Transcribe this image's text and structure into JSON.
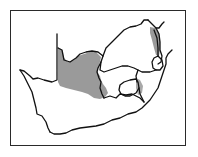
{
  "map": {
    "type": "distribution-map",
    "region": "Southern Africa",
    "colors": {
      "background": "#ffffff",
      "frame": "#2a2a2a",
      "borders": "#111111",
      "distribution_fill": "#9a9a9a"
    },
    "layers": [
      {
        "name": "frame",
        "description": "rectangular map border"
      },
      {
        "name": "country-borders",
        "description": "outline of South Africa, Lesotho, Swaziland and neighbouring borders"
      },
      {
        "name": "distribution-range",
        "description": "grey shaded species range: western-central interior and north-eastern strip"
      }
    ]
  }
}
